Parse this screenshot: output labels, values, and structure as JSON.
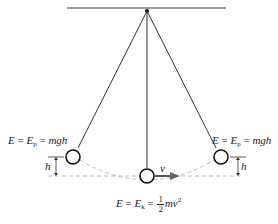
{
  "diagram": {
    "left_label": {
      "E": "E",
      "eq1": "=",
      "Ep": "E",
      "Ep_sub": "p",
      "eq2": "=",
      "expr": "mgh"
    },
    "right_label": {
      "E": "E",
      "eq1": "=",
      "Ep": "E",
      "Ep_sub": "p",
      "eq2": "=",
      "expr": "mgh"
    },
    "bottom_label": {
      "E": "E",
      "eq1": "=",
      "Ek": "E",
      "Ek_sub": "k",
      "eq2": "=",
      "frac_num": "1",
      "frac_den": "2",
      "expr": "mv",
      "exp": "2"
    },
    "velocity_label": "v",
    "height_label_left": "h",
    "height_label_right": "h",
    "colors": {
      "line": "#222222",
      "dashed": "#aaaaaa",
      "arrow": "#555555"
    }
  }
}
